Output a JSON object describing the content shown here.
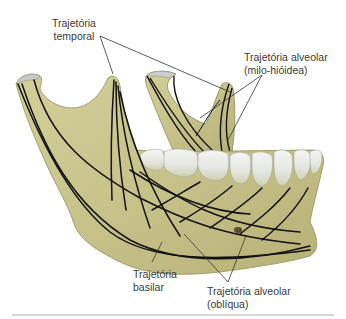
{
  "figure": {
    "colors": {
      "bone": "#c9c58e",
      "bone_shadow": "#a9a66a",
      "bone_outline": "#8f8c55",
      "teeth": "#e9ebe7",
      "teeth_shadow": "#c8ccc6",
      "trajectory_lines": "#111111",
      "leader_lines": "#333333",
      "label_text": "#3a3a3a",
      "divider": "#d9d4d6"
    }
  },
  "labels": {
    "temporal": {
      "line1": "Trajetória",
      "line2": "temporal"
    },
    "alveolar_milo": {
      "line1": "Trajetória alveolar",
      "line2": "(milo-hióidea)"
    },
    "basilar": {
      "line1": "Trajetória",
      "line2": "basilar"
    },
    "alveolar_obliqua": {
      "line1": "Trajetória alveolar",
      "line2": "(oblíqua)"
    }
  }
}
